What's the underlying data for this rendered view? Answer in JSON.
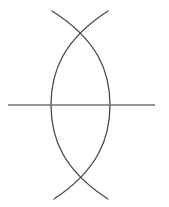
{
  "figure": {
    "title": "Vesica piscis geometric construction",
    "canvas": {
      "width": 169,
      "height": 207,
      "background_color": "#ffffff"
    },
    "colors": {
      "arc_stroke": "#4a4a4a",
      "line_stroke": "#737373"
    },
    "elements": [
      {
        "name": "left-arc",
        "kind": "arc",
        "stroke_color": "#4a4a4a",
        "stroke_width": 1.3,
        "start": [
          108,
          11
        ],
        "end": [
          108,
          199
        ],
        "extreme_point": [
          51,
          105
        ],
        "path": "M 108 11 C 63 40, 51 72, 51 105 C 51 138, 63 170, 108 199"
      },
      {
        "name": "right-arc",
        "kind": "arc",
        "stroke_color": "#4a4a4a",
        "stroke_width": 1.3,
        "start": [
          52,
          11
        ],
        "end": [
          54,
          199
        ],
        "extreme_point": [
          110,
          105
        ],
        "path": "M 52 11 C 98 40, 110 72, 110 105 C 110 138, 98 170, 54 199"
      },
      {
        "name": "horizontal-line",
        "kind": "line",
        "stroke_color": "#737373",
        "stroke_width": 1.4,
        "start": [
          8,
          105
        ],
        "end": [
          155,
          105
        ]
      }
    ],
    "intersections": [
      {
        "name": "top-crossing",
        "x": 80,
        "y": 30
      },
      {
        "name": "bottom-crossing",
        "x": 80,
        "y": 183
      },
      {
        "name": "left-line-crossing",
        "x": 51,
        "y": 105
      },
      {
        "name": "right-line-crossing",
        "x": 110,
        "y": 105
      }
    ]
  }
}
